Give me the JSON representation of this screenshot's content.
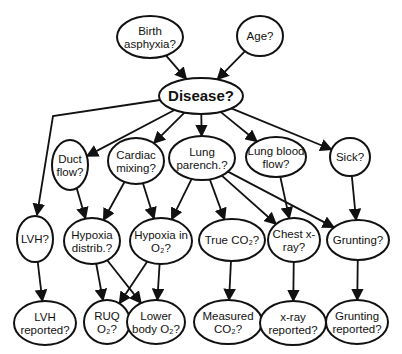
{
  "diagram": {
    "type": "bayesian-network",
    "nodes": [
      {
        "id": "birth-asphyxia",
        "lines": [
          "Birth",
          "asphyxia?"
        ]
      },
      {
        "id": "age",
        "lines": [
          "Age?"
        ]
      },
      {
        "id": "disease",
        "lines": [
          "Disease?"
        ]
      },
      {
        "id": "duct-flow",
        "lines": [
          "Duct",
          "flow?"
        ]
      },
      {
        "id": "cardiac-mixing",
        "lines": [
          "Cardiac",
          "mixing?"
        ]
      },
      {
        "id": "lung-parench",
        "lines": [
          "Lung",
          "parench.?"
        ]
      },
      {
        "id": "lung-blood-flow",
        "lines": [
          "Lung blood",
          "flow?"
        ]
      },
      {
        "id": "sick",
        "lines": [
          "Sick?"
        ]
      },
      {
        "id": "lvh",
        "lines": [
          "LVH?"
        ]
      },
      {
        "id": "hypoxia-distrib",
        "lines": [
          "Hypoxia",
          "distrib.?"
        ]
      },
      {
        "id": "hypoxia-in-o2",
        "lines": [
          "Hypoxia in",
          "O₂?"
        ]
      },
      {
        "id": "true-co2",
        "lines": [
          "True CO₂?"
        ]
      },
      {
        "id": "chest-xray",
        "lines": [
          "Chest x-",
          "ray?"
        ]
      },
      {
        "id": "grunting",
        "lines": [
          "Grunting?"
        ]
      },
      {
        "id": "lvh-reported",
        "lines": [
          "LVH",
          "reported?"
        ]
      },
      {
        "id": "ruq-o2",
        "lines": [
          "RUQ",
          "O₂?"
        ]
      },
      {
        "id": "lower-body-o2",
        "lines": [
          "Lower",
          "body O₂?"
        ]
      },
      {
        "id": "measured-co2",
        "lines": [
          "Measured",
          "CO₂?"
        ]
      },
      {
        "id": "xray-reported",
        "lines": [
          "x-ray",
          "reported?"
        ]
      },
      {
        "id": "grunting-reported",
        "lines": [
          "Grunting",
          "reported?"
        ]
      }
    ],
    "edges": [
      [
        "birth-asphyxia",
        "disease"
      ],
      [
        "age",
        "disease"
      ],
      [
        "disease",
        "lvh"
      ],
      [
        "disease",
        "duct-flow"
      ],
      [
        "disease",
        "cardiac-mixing"
      ],
      [
        "disease",
        "lung-parench"
      ],
      [
        "disease",
        "lung-blood-flow"
      ],
      [
        "disease",
        "sick"
      ],
      [
        "duct-flow",
        "hypoxia-distrib"
      ],
      [
        "cardiac-mixing",
        "hypoxia-distrib"
      ],
      [
        "cardiac-mixing",
        "hypoxia-in-o2"
      ],
      [
        "lung-parench",
        "hypoxia-in-o2"
      ],
      [
        "lung-parench",
        "true-co2"
      ],
      [
        "lung-parench",
        "chest-xray"
      ],
      [
        "lung-parench",
        "grunting"
      ],
      [
        "lung-blood-flow",
        "chest-xray"
      ],
      [
        "sick",
        "grunting"
      ],
      [
        "lvh",
        "lvh-reported"
      ],
      [
        "hypoxia-distrib",
        "ruq-o2"
      ],
      [
        "hypoxia-distrib",
        "lower-body-o2"
      ],
      [
        "hypoxia-in-o2",
        "ruq-o2"
      ],
      [
        "hypoxia-in-o2",
        "lower-body-o2"
      ],
      [
        "true-co2",
        "measured-co2"
      ],
      [
        "chest-xray",
        "xray-reported"
      ],
      [
        "grunting",
        "grunting-reported"
      ]
    ]
  }
}
